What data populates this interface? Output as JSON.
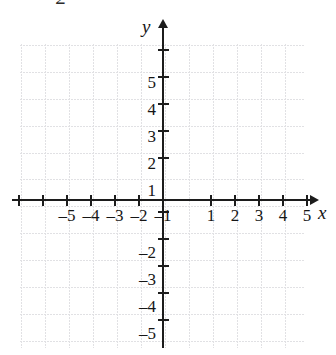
{
  "figure": {
    "number_partial": "2"
  },
  "chart_data": {
    "type": "scatter",
    "title": "",
    "subtitle": "",
    "xlabel": "x",
    "ylabel": "y",
    "xlim": [
      -5.9,
      6.1
    ],
    "ylim": [
      -5.6,
      6.2
    ],
    "grid": true,
    "grid_spacing": 1,
    "legend": null,
    "series": [],
    "x_ticks": [
      -5,
      -4,
      -3,
      -2,
      -1,
      1,
      2,
      3,
      4,
      5
    ],
    "y_ticks": [
      5,
      4,
      3,
      2,
      1,
      -1,
      -2,
      -3,
      -4,
      -5
    ],
    "x_tick_labels": [
      "–5",
      "–4",
      "–3",
      "–2",
      "–1",
      "1",
      "2",
      "3",
      "4",
      "5"
    ],
    "y_tick_labels": [
      "5",
      "4",
      "3",
      "2",
      "1",
      "",
      "–2",
      "–3",
      "–4",
      "–5"
    ],
    "annotations": []
  },
  "axes": {
    "x_label": "x",
    "y_label": "y",
    "x_arrow": "arrow-right-icon",
    "y_arrow": "arrow-up-icon"
  },
  "x_labels": [
    {
      "value": -5,
      "text": "–5",
      "px": 67
    },
    {
      "value": -4,
      "text": "–4",
      "px": 91
    },
    {
      "value": -3,
      "text": "–3",
      "px": 115
    },
    {
      "value": -2,
      "text": "–2",
      "px": 139
    },
    {
      "value": -1,
      "text": "–1",
      "px": 163
    },
    {
      "value": 1,
      "text": "1",
      "px": 211
    },
    {
      "value": 2,
      "text": "2",
      "px": 235
    },
    {
      "value": 3,
      "text": "3",
      "px": 259
    },
    {
      "value": 4,
      "text": "4",
      "px": 283
    },
    {
      "value": 5,
      "text": "5",
      "px": 307
    }
  ],
  "y_labels": [
    {
      "value": 5,
      "text": "5",
      "px": 83
    },
    {
      "value": 4,
      "text": "4",
      "px": 110
    },
    {
      "value": 3,
      "text": "3",
      "px": 137
    },
    {
      "value": 2,
      "text": "2",
      "px": 164
    },
    {
      "value": 1,
      "text": "1",
      "px": 191
    },
    {
      "value": -2,
      "text": "–2",
      "px": 253
    },
    {
      "value": -3,
      "text": "–3",
      "px": 280
    },
    {
      "value": -4,
      "text": "–4",
      "px": 307
    },
    {
      "value": -5,
      "text": "–5",
      "px": 334
    }
  ],
  "x_ticks_px": [
    19,
    43,
    67,
    91,
    115,
    139,
    211,
    235,
    259,
    283,
    307
  ],
  "y_ticks_px": [
    50,
    77,
    104,
    131,
    158,
    212,
    239,
    266,
    293,
    320
  ]
}
